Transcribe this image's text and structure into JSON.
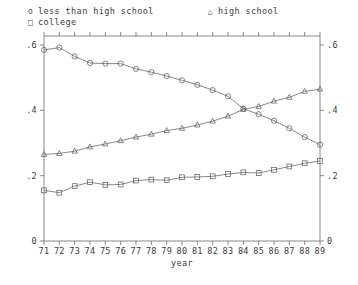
{
  "legend": {
    "entries": [
      {
        "marker": "o",
        "marker_name": "circle",
        "label": "less than high school"
      },
      {
        "marker": "△",
        "marker_name": "triangle",
        "label": "high school"
      },
      {
        "marker": "□",
        "marker_name": "square",
        "label": "college"
      }
    ]
  },
  "axes": {
    "x_title": "year",
    "y_left_ticks": [
      "0",
      ".2",
      ".4",
      ".6"
    ],
    "y_right_ticks": [
      "0",
      ".2",
      ".4",
      ".6"
    ]
  },
  "chart_data": {
    "type": "line",
    "title": "",
    "xlabel": "year",
    "ylabel": "",
    "xlim": [
      71,
      89
    ],
    "ylim": [
      0,
      0.6
    ],
    "grid": false,
    "legend_position": "top-left",
    "categories": [
      "71",
      "72",
      "73",
      "74",
      "75",
      "76",
      "77",
      "78",
      "79",
      "80",
      "81",
      "82",
      "83",
      "84",
      "85",
      "86",
      "87",
      "88",
      "89"
    ],
    "x": [
      71,
      72,
      73,
      74,
      75,
      76,
      77,
      78,
      79,
      80,
      81,
      82,
      83,
      84,
      85,
      86,
      87,
      88,
      89
    ],
    "series": [
      {
        "name": "less than high school",
        "marker": "circle",
        "values": [
          0.585,
          0.592,
          0.565,
          0.545,
          0.543,
          0.543,
          0.527,
          0.517,
          0.505,
          0.492,
          0.478,
          0.462,
          0.443,
          0.405,
          0.388,
          0.368,
          0.345,
          0.318,
          0.295
        ]
      },
      {
        "name": "high school",
        "marker": "triangle",
        "values": [
          0.265,
          0.268,
          0.275,
          0.288,
          0.297,
          0.307,
          0.318,
          0.327,
          0.338,
          0.345,
          0.355,
          0.367,
          0.382,
          0.403,
          0.412,
          0.428,
          0.44,
          0.458,
          0.465
        ]
      },
      {
        "name": "college",
        "marker": "square",
        "values": [
          0.155,
          0.148,
          0.168,
          0.18,
          0.172,
          0.173,
          0.185,
          0.188,
          0.186,
          0.195,
          0.196,
          0.198,
          0.205,
          0.21,
          0.208,
          0.218,
          0.228,
          0.238,
          0.245
        ]
      }
    ]
  }
}
